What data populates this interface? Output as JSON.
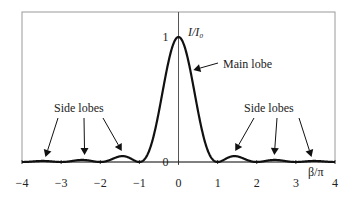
{
  "chart_data": {
    "type": "line",
    "title": "",
    "xlabel": "β/π",
    "ylabel": "I/I₀",
    "xlim": [
      -4,
      4
    ],
    "ylim": [
      0,
      1
    ],
    "x_ticks": [
      -4,
      -3,
      -2,
      -1,
      0,
      1,
      2,
      3,
      4
    ],
    "x_tick_labels": [
      "−4",
      "−3",
      "−2",
      "−1",
      "0",
      "1",
      "2",
      "3",
      "4"
    ],
    "y_ticks": [
      0,
      1
    ],
    "y_tick_labels": [
      "0",
      "1"
    ],
    "grid": false,
    "legend": "none",
    "series": [
      {
        "name": "I/I0",
        "function": "sinc^2",
        "description": "Normalized intensity (sin β / β)^2 vs β/π",
        "points": [
          [
            -4.0,
            0.0
          ],
          [
            -3.5,
            0.008
          ],
          [
            -3.0,
            0.0
          ],
          [
            -2.5,
            0.016
          ],
          [
            -2.0,
            0.0
          ],
          [
            -1.43,
            0.047
          ],
          [
            -1.0,
            0.0
          ],
          [
            -0.5,
            0.405
          ],
          [
            0.0,
            1.0
          ],
          [
            0.5,
            0.405
          ],
          [
            1.0,
            0.0
          ],
          [
            1.43,
            0.047
          ],
          [
            2.0,
            0.0
          ],
          [
            2.5,
            0.016
          ],
          [
            3.0,
            0.0
          ],
          [
            3.5,
            0.008
          ],
          [
            4.0,
            0.0
          ]
        ]
      }
    ],
    "annotations": [
      {
        "text": "Main lobe",
        "target_x": 0.35,
        "target_y": 0.75
      },
      {
        "text": "Side lobes",
        "side": "left",
        "arrow_targets_x": [
          -3.4,
          -2.4,
          -1.45
        ]
      },
      {
        "text": "Side lobes",
        "side": "right",
        "arrow_targets_x": [
          1.45,
          2.45,
          3.4
        ]
      }
    ]
  }
}
